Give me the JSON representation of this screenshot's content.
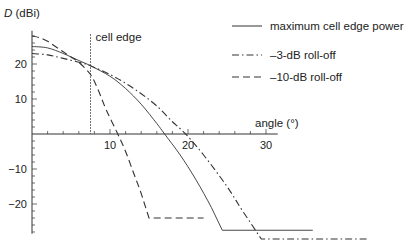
{
  "chart_data": {
    "type": "line",
    "title": "",
    "xlabel": "angle (°)",
    "ylabel_italic": "D",
    "ylabel": " (dBi)",
    "xlim": [
      0,
      44
    ],
    "ylim": [
      -30,
      30
    ],
    "xticks": [
      10,
      20,
      30
    ],
    "yticks": [
      20,
      10,
      -10,
      -20
    ],
    "grid": false,
    "legend_position": "top-right",
    "annotation": {
      "label": "cell edge",
      "x": 7.5
    },
    "series": [
      {
        "name": "maximum cell edge power",
        "style": "solid",
        "x": [
          0,
          2,
          4,
          6,
          7.5,
          10,
          12,
          14,
          16,
          17,
          19,
          21,
          23,
          24.4,
          36
        ],
        "y": [
          25,
          24.6,
          23,
          21,
          19.5,
          16.5,
          13,
          8.5,
          3,
          0,
          -6,
          -13,
          -21,
          -27.5,
          -27.5
        ]
      },
      {
        "name": "–3-dB roll-off",
        "style": "dashdot",
        "x": [
          0,
          2,
          4,
          6,
          7.5,
          10,
          12,
          14,
          16,
          18,
          19.7,
          22,
          25,
          27,
          29.4,
          43
        ],
        "y": [
          23,
          22.6,
          21.6,
          20.5,
          19.5,
          17,
          14.5,
          11.5,
          8,
          3.5,
          0,
          -6,
          -15,
          -22,
          -30,
          -30
        ]
      },
      {
        "name": "–10-dB roll-off",
        "style": "dashed",
        "x": [
          0,
          1,
          2,
          3,
          4,
          5,
          6,
          7.5,
          8.5,
          9.5,
          11,
          12,
          13,
          14,
          15,
          22
        ],
        "y": [
          28,
          27.5,
          26.5,
          25,
          23.5,
          22,
          20.5,
          17,
          12.5,
          7,
          0,
          -5,
          -11,
          -17,
          -24,
          -24
        ]
      }
    ]
  }
}
